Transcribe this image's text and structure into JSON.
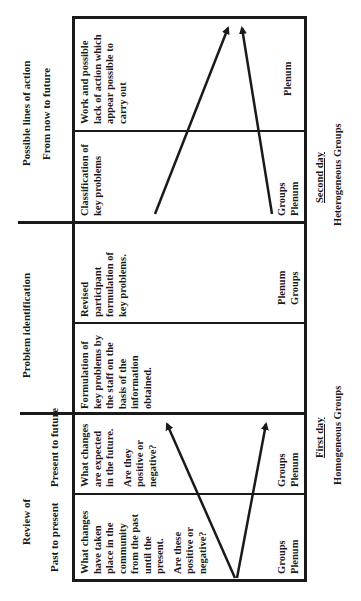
{
  "orientation": "rotated-90-ccw",
  "headers": {
    "review": {
      "title": "Review of",
      "past_to_present": "Past to present",
      "present_to_future": "Present to future"
    },
    "problem_identification": {
      "title": "Problem identification"
    },
    "possible_lines": {
      "title": "Possible lines of action",
      "subtitle": "From now to future"
    }
  },
  "cells": [
    {
      "id": "past-to-present",
      "lines": [
        "What changes",
        "have taken",
        "place in the",
        "community",
        "from the past",
        "until the",
        "present."
      ],
      "question": [
        "Are these",
        "positive or",
        "negative?"
      ],
      "mode": [
        "Groups",
        "Plenum"
      ]
    },
    {
      "id": "present-to-future",
      "lines": [
        "What changes",
        "are expected",
        "in the future."
      ],
      "question": [
        "Are they",
        "positive or",
        "negative?"
      ],
      "mode": [
        "Groups",
        "Plenum"
      ]
    },
    {
      "id": "staff-formulation",
      "lines": [
        "Formulation of",
        "key problems by",
        "the staff on the",
        "basis of the",
        "information",
        "obtained."
      ],
      "question": [],
      "mode": []
    },
    {
      "id": "participant-formulation",
      "lines": [
        "Revised",
        "participant",
        "formulation of",
        "key problems."
      ],
      "question": [],
      "mode": [
        "Plenum",
        "Groups"
      ]
    },
    {
      "id": "classification",
      "lines": [
        "Classification of",
        "key problems"
      ],
      "question": [],
      "mode": [
        "Groups",
        "Plenum"
      ]
    },
    {
      "id": "lines-of-action",
      "lines": [
        "Work and possible",
        "lack of action which",
        "appear possible to",
        "carry out"
      ],
      "question": [],
      "mode": [
        "Plenum"
      ]
    }
  ],
  "footers": {
    "first_day": "First day",
    "first_group": "Homogeneous Groups",
    "second_day": "Second day",
    "second_group": "Heterogeneous  Groups"
  },
  "colors": {
    "ink": "#1a1a1a",
    "background": "#ffffff"
  }
}
